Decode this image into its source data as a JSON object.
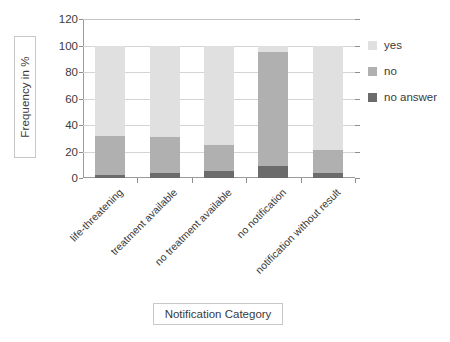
{
  "chart_data": {
    "type": "bar",
    "stacked": true,
    "title": "",
    "xlabel": "Notification Category",
    "ylabel": "Frequency in %",
    "ylim": [
      0,
      120
    ],
    "yticks": [
      0,
      20,
      40,
      60,
      80,
      100,
      120
    ],
    "grid": true,
    "legend_position": "right",
    "categories": [
      "life-threatening",
      "treatment available",
      "no treatment available",
      "no notification",
      "notification without result"
    ],
    "series": [
      {
        "name": "no answer",
        "color": "#6b6b6b",
        "values": [
          2,
          4,
          5,
          9,
          4
        ]
      },
      {
        "name": "no",
        "color": "#b0b0b0",
        "values": [
          30,
          27,
          20,
          86,
          17
        ]
      },
      {
        "name": "yes",
        "color": "#e0e0e0",
        "values": [
          68,
          69,
          75,
          5,
          79
        ]
      }
    ],
    "stack_order_bottom_to_top": [
      "no answer",
      "no",
      "yes"
    ],
    "bar_totals": [
      100,
      100,
      100,
      100,
      100
    ]
  },
  "legend": {
    "items": [
      {
        "label": "yes",
        "color": "#e0e0e0"
      },
      {
        "label": "no",
        "color": "#b0b0b0"
      },
      {
        "label": "no answer",
        "color": "#6b6b6b"
      }
    ]
  },
  "axes": {
    "y_title": "Frequency in %",
    "x_title": "Notification Category",
    "y_tick_labels": [
      "120",
      "100",
      "80",
      "60",
      "40",
      "20",
      "0"
    ]
  },
  "colors": {
    "yes": "#e0e0e0",
    "no": "#b0b0b0",
    "no_answer": "#6b6b6b",
    "grid": "#d4d4d4",
    "axis": "#9a9a9a",
    "text": "#3a3a3a",
    "background": "#ffffff"
  }
}
